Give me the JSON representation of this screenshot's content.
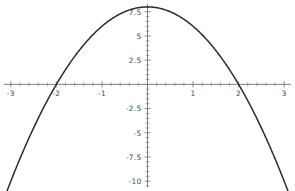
{
  "chart_data": {
    "type": "line",
    "title": "",
    "subtitle": "",
    "xlabel": "",
    "ylabel": "",
    "xlim": [
      -3.15,
      3.15
    ],
    "ylim": [
      -10.6,
      8.3
    ],
    "grid": false,
    "legend": null,
    "axes_style": "origin-crossing",
    "x_ticks_major": [
      -3,
      -2,
      -1,
      1,
      2,
      3
    ],
    "x_tick_labels": [
      "-3",
      "-2",
      "-1",
      "1",
      "2",
      "3"
    ],
    "x_minor_step": 0.2,
    "y_ticks_major": [
      7.5,
      5,
      2.5,
      -2.5,
      -5,
      -7.5,
      -10
    ],
    "y_tick_labels": [
      "7.5",
      "5",
      "2.5",
      "-2.5",
      "-5",
      "-7.5",
      "-10"
    ],
    "y_minor_step": 0.5,
    "series": [
      {
        "name": "y = 8 - 2x^2",
        "expression": "8 - 2*x^2",
        "color": "#2b2b2b",
        "vertex": [
          0,
          8
        ],
        "roots": [
          -2,
          2
        ],
        "x": [
          -3.0,
          -2.8,
          -2.6,
          -2.4,
          -2.2,
          -2.0,
          -1.8,
          -1.6,
          -1.4,
          -1.2,
          -1.0,
          -0.8,
          -0.6,
          -0.4,
          -0.2,
          0.0,
          0.2,
          0.4,
          0.6,
          0.8,
          1.0,
          1.2,
          1.4,
          1.6,
          1.8,
          2.0,
          2.2,
          2.4,
          2.6,
          2.8,
          3.0
        ],
        "values": [
          -10.0,
          -7.68,
          -5.52,
          -3.52,
          -1.68,
          0.0,
          1.52,
          2.88,
          4.08,
          5.12,
          6.0,
          6.72,
          7.28,
          7.68,
          7.92,
          8.0,
          7.92,
          7.68,
          7.28,
          6.72,
          6.0,
          5.12,
          4.08,
          2.88,
          1.52,
          0.0,
          -1.68,
          -3.52,
          -5.52,
          -7.68,
          -10.0
        ]
      }
    ],
    "colors": {
      "background": "#ffffff",
      "curve": "#2b2b2b",
      "axis": "#6e6e78",
      "tick_text": "#4a4a52"
    }
  }
}
